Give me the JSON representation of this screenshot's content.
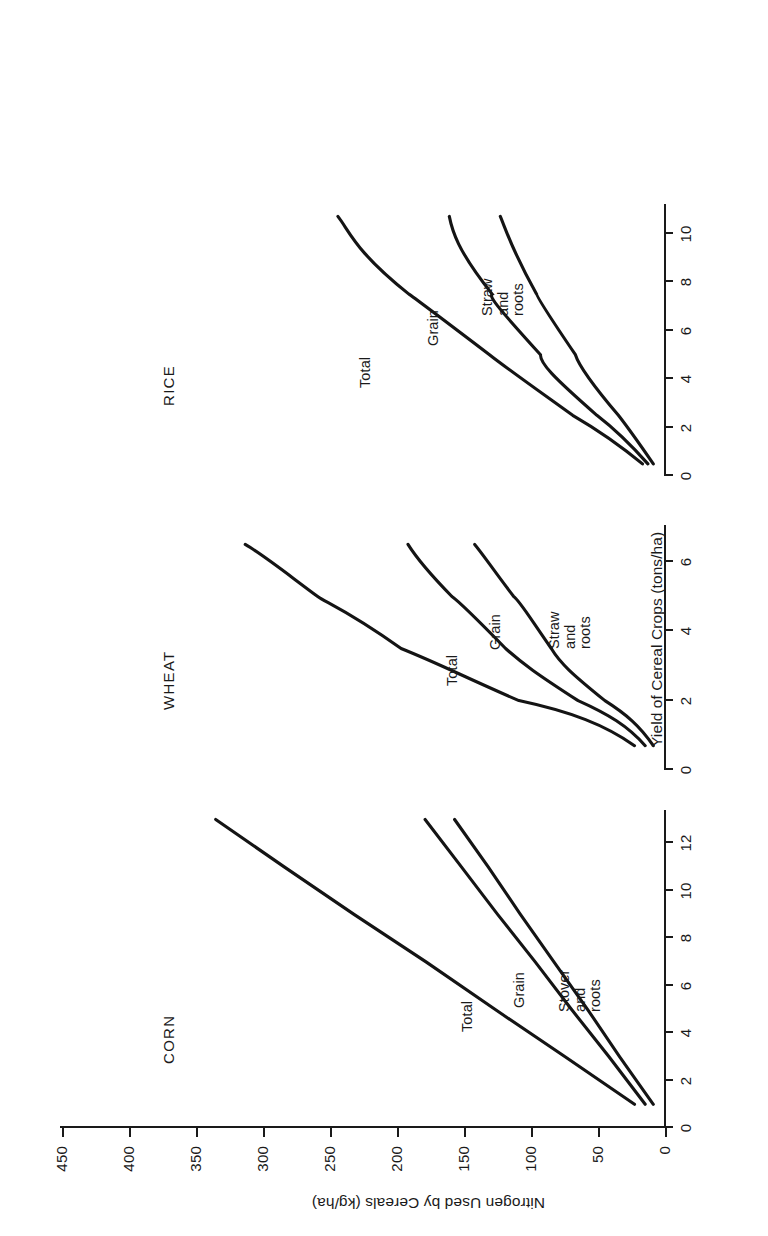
{
  "figure": {
    "orientation": "rotated-90-ccw",
    "background": "#ffffff",
    "ink_color": "#141414"
  },
  "axes": {
    "y_title": "Nitrogen Used by Cereals (kg/ha)",
    "x_title": "Yield of Cereal Crops (tons/ha)",
    "y_ticks": [
      "0",
      "50",
      "100",
      "150",
      "200",
      "250",
      "300",
      "350",
      "400",
      "450"
    ],
    "y_min": 0,
    "y_max": 450
  },
  "panels": [
    {
      "title": "CORN",
      "x_ticks": [
        "0",
        "2",
        "4",
        "6",
        "8",
        "10",
        "12"
      ],
      "x_min": 0,
      "x_max": 13.4,
      "curve_labels": [
        {
          "text": "Total"
        },
        {
          "text": "Grain"
        },
        {
          "text": "Stover\nand\nroots"
        }
      ]
    },
    {
      "title": "WHEAT",
      "x_ticks": [
        "0",
        "2",
        "4",
        "6"
      ],
      "x_min": 0,
      "x_max": 7.0,
      "curve_labels": [
        {
          "text": "Total"
        },
        {
          "text": "Grain"
        },
        {
          "text": "Straw\nand\nroots"
        }
      ]
    },
    {
      "title": "RICE",
      "x_ticks": [
        "0",
        "2",
        "4",
        "6",
        "8",
        "10"
      ],
      "x_min": 0,
      "x_max": 11.2,
      "curve_labels": [
        {
          "text": "Total"
        },
        {
          "text": "Grain"
        },
        {
          "text": "Straw\nand\nroots"
        }
      ]
    }
  ],
  "chart_data": {
    "type": "line",
    "title": "",
    "xlabel": "Yield of Cereal Crops (tons/ha)",
    "ylabel": "Nitrogen Used by Cereals (kg/ha)",
    "ylim": [
      0,
      450
    ],
    "grid": false,
    "legend": "inline-curve-labels",
    "panels": [
      {
        "name": "CORN",
        "xlim": [
          0,
          13.4
        ],
        "xticks": [
          0,
          2,
          4,
          6,
          8,
          10,
          12
        ],
        "series": [
          {
            "name": "Total",
            "x": [
              1.0,
              3.0,
              5.0,
              7.0,
              9.0,
              11.0,
              13.0
            ],
            "y": [
              22,
              74,
              126,
              178,
              231,
              283,
              334
            ]
          },
          {
            "name": "Grain",
            "x": [
              1.0,
              3.0,
              5.0,
              7.0,
              9.0,
              11.0,
              13.0
            ],
            "y": [
              14,
              41,
              69,
              96,
              124,
              151,
              178
            ]
          },
          {
            "name": "Stover and roots",
            "x": [
              1.0,
              3.0,
              5.0,
              7.0,
              9.0,
              11.0,
              13.0
            ],
            "y": [
              8,
              33,
              57,
              82,
              107,
              131,
              156
            ]
          }
        ]
      },
      {
        "name": "WHEAT",
        "xlim": [
          0,
          7.0
        ],
        "xticks": [
          0,
          2,
          4,
          6
        ],
        "series": [
          {
            "name": "Total",
            "x": [
              0.7,
              2.0,
              3.5,
              5.0,
              6.5
            ],
            "y": [
              22,
              108,
              196,
              258,
              312
            ]
          },
          {
            "name": "Grain",
            "x": [
              0.7,
              2.0,
              3.5,
              5.0,
              6.5
            ],
            "y": [
              14,
              64,
              118,
              158,
              190
            ]
          },
          {
            "name": "Straw and roots",
            "x": [
              0.7,
              2.0,
              3.5,
              5.0,
              6.5
            ],
            "y": [
              8,
              44,
              84,
              112,
              141
            ]
          }
        ]
      },
      {
        "name": "RICE",
        "xlim": [
          0,
          11.2
        ],
        "xticks": [
          0,
          2,
          4,
          6,
          8,
          10
        ],
        "series": [
          {
            "name": "Total",
            "x": [
              0.5,
              2.5,
              5.0,
              7.5,
              10.7
            ],
            "y": [
              16,
              68,
              130,
              190,
              243
            ]
          },
          {
            "name": "Grain",
            "x": [
              0.5,
              2.5,
              5.0,
              7.5,
              10.7
            ],
            "y": [
              12,
              50,
              92,
              128,
              160
            ]
          },
          {
            "name": "Straw and roots",
            "x": [
              0.5,
              2.5,
              5.0,
              7.5,
              10.7
            ],
            "y": [
              8,
              34,
              66,
              95,
              122
            ]
          }
        ]
      }
    ]
  }
}
